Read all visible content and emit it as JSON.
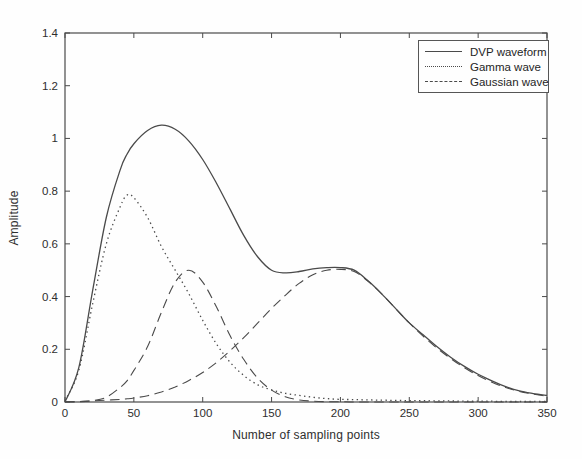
{
  "chart_data": {
    "type": "line",
    "title": "",
    "xlabel": "Number of sampling points",
    "ylabel": "Amplitude",
    "xlim": [
      0,
      350
    ],
    "ylim": [
      0,
      1.4
    ],
    "grid": false,
    "xticks": [
      0,
      50,
      100,
      150,
      200,
      250,
      300,
      350
    ],
    "xtick_labels": [
      "0",
      "50",
      "100",
      "150",
      "200",
      "250",
      "300",
      "350"
    ],
    "yticks": [
      0,
      0.2,
      0.4,
      0.6,
      0.8,
      1,
      1.2,
      1.4
    ],
    "ytick_labels": [
      "0",
      "0.2",
      "0.4",
      "0.6",
      "0.8",
      "1",
      "1.2",
      "1.4"
    ],
    "line_color": "#4a4a4a",
    "text_color": "#2e2e2e",
    "legend_position": "top-right",
    "legend": [
      {
        "label": "DVP waveform",
        "style": "solid"
      },
      {
        "label": "Gamma wave",
        "style": "dotted"
      },
      {
        "label": "Gaussian wave",
        "style": "dashed"
      }
    ],
    "x": [
      0,
      10,
      20,
      30,
      40,
      45,
      50,
      60,
      70,
      80,
      90,
      100,
      110,
      120,
      130,
      140,
      150,
      160,
      170,
      180,
      190,
      200,
      210,
      220,
      230,
      240,
      250,
      260,
      270,
      280,
      290,
      300,
      310,
      320,
      330,
      340,
      350
    ],
    "series": [
      {
        "name": "DVP waveform",
        "style": "solid",
        "values": [
          0.0,
          0.13,
          0.42,
          0.7,
          0.88,
          0.94,
          0.98,
          1.03,
          1.05,
          1.035,
          0.99,
          0.92,
          0.83,
          0.73,
          0.63,
          0.55,
          0.5,
          0.49,
          0.495,
          0.505,
          0.51,
          0.51,
          0.5,
          0.46,
          0.41,
          0.355,
          0.3,
          0.255,
          0.21,
          0.17,
          0.135,
          0.105,
          0.08,
          0.058,
          0.042,
          0.032,
          0.025
        ]
      },
      {
        "name": "Gamma wave",
        "style": "dotted",
        "values": [
          0.005,
          0.12,
          0.37,
          0.6,
          0.74,
          0.785,
          0.775,
          0.7,
          0.59,
          0.5,
          0.41,
          0.31,
          0.22,
          0.15,
          0.1,
          0.065,
          0.046,
          0.033,
          0.025,
          0.018,
          0.013,
          0.01,
          0.009,
          0.008,
          0.007,
          0.006,
          0.005,
          0.005,
          0.004,
          0.004,
          0.003,
          0.003,
          0.003,
          0.002,
          0.002,
          0.002,
          0.002
        ]
      },
      {
        "name": "Gaussian wave (component 1)",
        "style": "dashed",
        "values": [
          0.0,
          0.001,
          0.005,
          0.018,
          0.055,
          0.08,
          0.12,
          0.21,
          0.34,
          0.455,
          0.5,
          0.455,
          0.36,
          0.25,
          0.16,
          0.09,
          0.045,
          0.02,
          0.008,
          0.003,
          0.001,
          0.001,
          0.0,
          0.0,
          0.0,
          0.0,
          0.0,
          0.0,
          0.0,
          0.0,
          0.0,
          0.0,
          0.0,
          0.0,
          0.0,
          0.0,
          0.0
        ]
      },
      {
        "name": "Gaussian wave (component 2)",
        "style": "dashed",
        "values": [
          0.001,
          0.002,
          0.004,
          0.007,
          0.01,
          0.012,
          0.015,
          0.024,
          0.038,
          0.057,
          0.082,
          0.112,
          0.15,
          0.195,
          0.245,
          0.3,
          0.355,
          0.405,
          0.45,
          0.483,
          0.5,
          0.503,
          0.495,
          0.458,
          0.41,
          0.355,
          0.3,
          0.25,
          0.205,
          0.165,
          0.13,
          0.1,
          0.075,
          0.055,
          0.04,
          0.03,
          0.022
        ]
      }
    ]
  }
}
